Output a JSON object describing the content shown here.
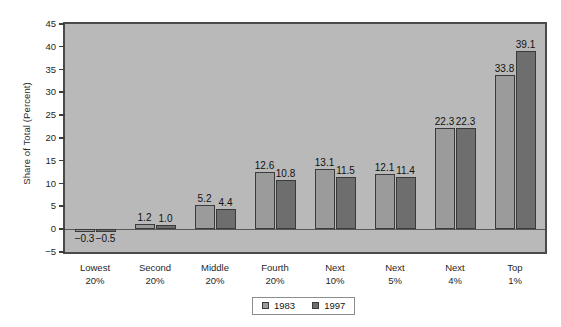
{
  "chart_data": {
    "type": "bar",
    "title": "",
    "subtitle": "",
    "xlabel": "",
    "ylabel": "Share of Total (Percent)",
    "ylim": [
      -5,
      45
    ],
    "ytick_step": 5,
    "yticks": [
      "45",
      "40",
      "35",
      "30",
      "25",
      "20",
      "15",
      "10",
      "5",
      "0",
      "-5"
    ],
    "ytick_values": [
      45,
      40,
      35,
      30,
      25,
      20,
      15,
      10,
      5,
      0,
      -5
    ],
    "grid": false,
    "legend_position": "bottom-center",
    "categories": [
      "Lowest\n20%",
      "Second\n20%",
      "Middle\n20%",
      "Fourth\n20%",
      "Next\n10%",
      "Next\n5%",
      "Next\n4%",
      "Top\n1%"
    ],
    "category_lines": [
      [
        "Lowest",
        "20%"
      ],
      [
        "Second",
        "20%"
      ],
      [
        "Middle",
        "20%"
      ],
      [
        "Fourth",
        "20%"
      ],
      [
        "Next",
        "10%"
      ],
      [
        "Next",
        "5%"
      ],
      [
        "Next",
        "4%"
      ],
      [
        "Top",
        "1%"
      ]
    ],
    "series": [
      {
        "name": "1983",
        "color": "#9b9b9b",
        "values": [
          -0.3,
          1.2,
          5.2,
          12.6,
          13.1,
          12.1,
          22.3,
          33.8
        ],
        "labels": [
          "−0.3",
          "1.2",
          "5.2",
          "12.6",
          "13.1",
          "12.1",
          "22.3",
          "33.8"
        ]
      },
      {
        "name": "1997",
        "color": "#6e6e6e",
        "values": [
          -0.5,
          1.0,
          4.4,
          10.8,
          11.5,
          11.4,
          22.3,
          39.1
        ],
        "labels": [
          "−0.5",
          "1.0",
          "4.4",
          "10.8",
          "11.5",
          "11.4",
          "22.3",
          "39.1"
        ]
      }
    ],
    "colors": {
      "plot_background": "#b9b9b9",
      "frame": "#4a4a4a",
      "series_1983": "#9b9b9b",
      "series_1997": "#6e6e6e",
      "page_background": "#ffffff"
    }
  },
  "legend": {
    "items": [
      {
        "label": "1983",
        "swatch": "#9b9b9b"
      },
      {
        "label": "1997",
        "swatch": "#6e6e6e"
      }
    ]
  }
}
